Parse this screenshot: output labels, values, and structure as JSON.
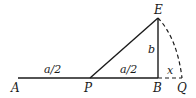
{
  "diagram": {
    "points": {
      "A": "A",
      "P": "P",
      "B": "B",
      "Q": "Q",
      "E": "E"
    },
    "segment_labels": {
      "AP": "a/2",
      "PB": "a/2",
      "BE": "b",
      "BQ": "x"
    },
    "colors": {
      "stroke": "#1a1a1a",
      "background": "#ffffff"
    }
  }
}
